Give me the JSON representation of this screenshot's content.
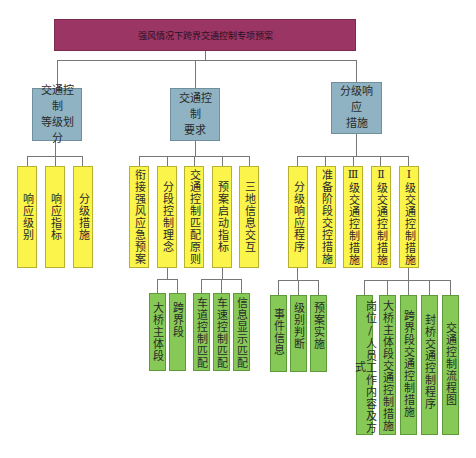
{
  "root": {
    "label": "强风情况下跨界交通控制专项预案",
    "color": "#9b3563"
  },
  "level1": [
    {
      "label": "交通控制等级划分",
      "lines": [
        "交通控制",
        "等级划分"
      ]
    },
    {
      "label": "交通控制要求",
      "lines": [
        "交通控制",
        "要求"
      ]
    },
    {
      "label": "分级响应措施",
      "lines": [
        "分级响应",
        "措施"
      ]
    }
  ],
  "level2": {
    "grading": [
      "响应级别",
      "响应指标",
      "分级措施"
    ],
    "requirements": [
      "衔接强风应急预案",
      "分段控制理念",
      "交通控制匹配原则",
      "预案启动指标",
      "三地信息交互"
    ],
    "measures": [
      "分级响应程序",
      "准备阶段交控措施",
      "Ⅲ级交通控制措施",
      "Ⅱ级交通控制措施",
      "Ⅰ级交通控制措施"
    ]
  },
  "level3": {
    "segmented_control": [
      "大桥主体段",
      "跨界段"
    ],
    "activation_indicators": [
      "车道控制匹配",
      "车速控制匹配",
      "信息显示匹配"
    ],
    "response_procedure": [
      "事件信息",
      "级别判断",
      "预案实施"
    ],
    "level1_measures": [
      "岗位/人员工作内容及方式",
      "大桥主体段交通控制措施",
      "跨界段交通控制措施",
      "封桥交通控制程序",
      "交通控制流程图"
    ]
  },
  "colors": {
    "level1": "#8fb3c2",
    "level2": "#fbf44a",
    "level3": "#86c956",
    "connector": "#777777"
  }
}
